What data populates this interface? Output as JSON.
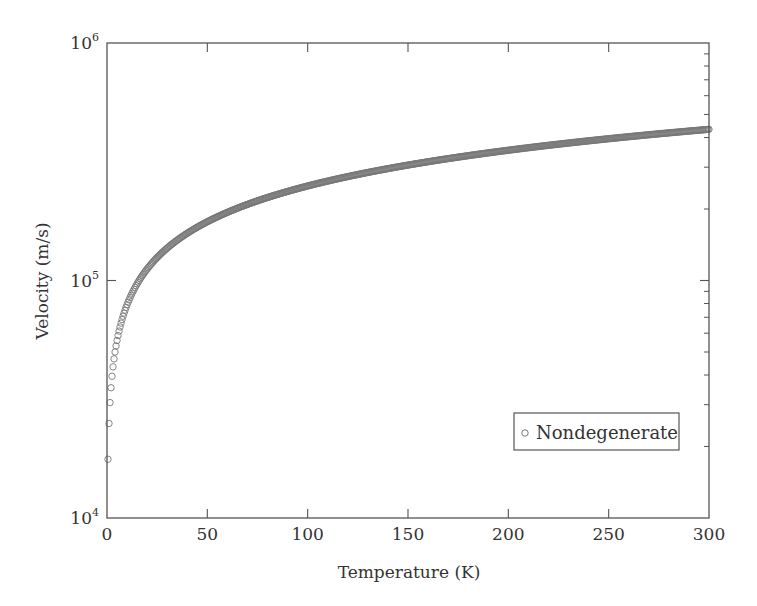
{
  "chart_data": {
    "type": "scatter",
    "title": "",
    "xlabel": "Temperature (K)",
    "ylabel": "Velocity (m/s)",
    "xlim": [
      0,
      300
    ],
    "ylim": [
      10000,
      1000000
    ],
    "yscale": "log",
    "grid": false,
    "legend_position": "lower right",
    "x_ticks": [
      0,
      50,
      100,
      150,
      200,
      250,
      300
    ],
    "x_tick_labels": [
      "0",
      "50",
      "100",
      "150",
      "200",
      "250",
      "300"
    ],
    "y_ticks": [
      10000,
      100000,
      1000000
    ],
    "y_tick_labels": [
      {
        "base": "10",
        "exp": "4"
      },
      {
        "base": "10",
        "exp": "5"
      },
      {
        "base": "10",
        "exp": "6"
      }
    ],
    "series": [
      {
        "name": "Nondegenerate",
        "marker": "open-circle",
        "color": "#777777",
        "model": "v = 25000 * sqrt(T)",
        "coefficient": 25000,
        "t_start": 0.5,
        "t_end": 300,
        "t_step": 0.5,
        "sample_points": [
          {
            "x": 0.5,
            "y": 23700
          },
          {
            "x": 1,
            "y": 31000
          },
          {
            "x": 1.5,
            "y": 37300
          },
          {
            "x": 3,
            "y": 44800
          },
          {
            "x": 4,
            "y": 52500
          },
          {
            "x": 10,
            "y": 79000
          },
          {
            "x": 25,
            "y": 125000
          },
          {
            "x": 50,
            "y": 177000
          },
          {
            "x": 100,
            "y": 250000
          },
          {
            "x": 150,
            "y": 306000
          },
          {
            "x": 200,
            "y": 354000
          },
          {
            "x": 250,
            "y": 395000
          },
          {
            "x": 300,
            "y": 434000
          }
        ]
      }
    ]
  },
  "legend": {
    "label": "Nondegenerate"
  },
  "colors": {
    "axis": "#555555",
    "marker": "#777777",
    "text": "#333333"
  }
}
